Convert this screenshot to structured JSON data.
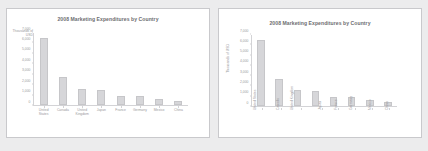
{
  "chart_data": [
    {
      "id": "left",
      "type": "bar",
      "title": "2008 Marketing Expenditures by Country",
      "categories": [
        "United States",
        "Canada",
        "United Kingdom",
        "Japan",
        "France",
        "Germany",
        "Mexico",
        "China"
      ],
      "values": [
        6500,
        2700,
        1600,
        1500,
        900,
        850,
        600,
        400
      ],
      "xlabel": "",
      "ylabel": "Thousands of USD",
      "ylabel_orientation": "horizontal",
      "xlabel_orientation": "horizontal",
      "ylim": [
        0,
        7000
      ],
      "yticks": [
        0,
        1000,
        2000,
        3000,
        4000,
        5000,
        6000,
        7000
      ],
      "ytick_labels": [
        "0",
        "1,000",
        "2,000",
        "3,000",
        "4,000",
        "5,000",
        "6,000",
        "7,000"
      ],
      "grid": false,
      "legend": "none",
      "bar_color": "#d6d6d9"
    },
    {
      "id": "right",
      "type": "bar",
      "title": "2008 Marketing Expenditures by Country",
      "categories": [
        "United States",
        "Canada",
        "United Kingdom",
        "Japan",
        "France",
        "Germany",
        "Mexico",
        "China"
      ],
      "values": [
        6500,
        2700,
        1600,
        1500,
        900,
        850,
        600,
        400
      ],
      "xlabel": "",
      "ylabel": "Thousands of USD",
      "ylabel_orientation": "vertical",
      "xlabel_orientation": "vertical",
      "ylim": [
        0,
        7000
      ],
      "yticks": [
        0,
        1000,
        2000,
        3000,
        4000,
        5000,
        6000,
        7000
      ],
      "ytick_labels": [
        "0",
        "1,000",
        "2,000",
        "3,000",
        "4,000",
        "5,000",
        "6,000",
        "7,000"
      ],
      "grid": false,
      "legend": "none",
      "bar_color": "#d6d6d9"
    }
  ]
}
